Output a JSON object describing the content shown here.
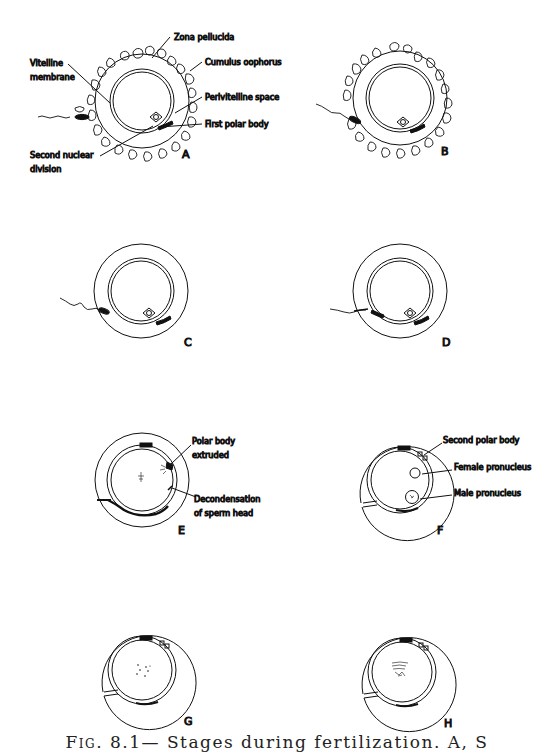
{
  "figure": {
    "title": "Stages during fertilization",
    "caption": {
      "fig_label": "Fig. 8.1—",
      "text": "Stages during fertilization. A, S"
    },
    "panels": [
      {
        "id": "A",
        "label": "A",
        "annotations": [
          "Zona pellucida",
          "Cumulus oophorus",
          "Vitelline",
          "membrane",
          "Perivitelline space",
          "First polar body",
          "Second nuclear",
          "division"
        ]
      },
      {
        "id": "B",
        "label": "B",
        "annotations": []
      },
      {
        "id": "C",
        "label": "C",
        "annotations": []
      },
      {
        "id": "D",
        "label": "D",
        "annotations": []
      },
      {
        "id": "E",
        "label": "E",
        "annotations": [
          "Polar body",
          "extruded",
          "Decondensation",
          "of sperm head"
        ]
      },
      {
        "id": "F",
        "label": "F",
        "annotations": [
          "Second polar body",
          "Female pronucleus",
          "Male pronucleus"
        ]
      },
      {
        "id": "G",
        "label": "G",
        "annotations": []
      },
      {
        "id": "H",
        "label": "H",
        "annotations": []
      }
    ],
    "colors": {
      "ink": "#111111",
      "background": "#ffffff"
    }
  }
}
